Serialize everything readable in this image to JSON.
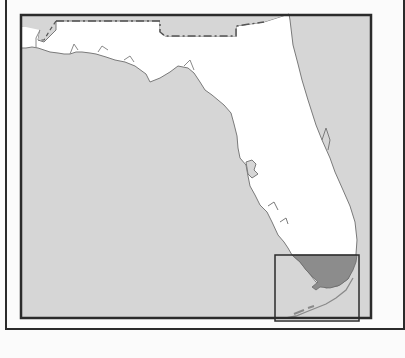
{
  "map": {
    "subject": "Florida",
    "highlighted_region": "South Florida (Miami-Dade area)",
    "colors": {
      "water": "#d6d6d6",
      "land": "#ffffff",
      "highlight": "#8c8c8c",
      "border": "#2b2b2b",
      "coastline": "#7a7a7a",
      "page_background": "#fbfbfb"
    },
    "features": [
      {
        "name": "state-boundary-georgia-alabama",
        "style": "dash-dot"
      },
      {
        "name": "panhandle"
      },
      {
        "name": "peninsula"
      },
      {
        "name": "florida-keys"
      },
      {
        "name": "locator-inset-box"
      }
    ]
  }
}
